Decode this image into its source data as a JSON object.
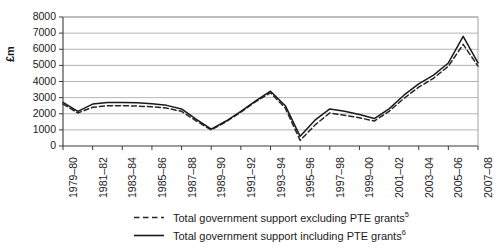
{
  "chart_data": {
    "type": "line",
    "title": "",
    "xlabel": "",
    "ylabel": "£m",
    "ylim": [
      0,
      8000
    ],
    "ytick_step": 1000,
    "yticks": [
      "8000",
      "7000",
      "6000",
      "5000",
      "4000",
      "3000",
      "2000",
      "1000",
      "0"
    ],
    "grid": true,
    "legend_position": "bottom",
    "x": [
      "1979–80",
      "1980–81",
      "1981–82",
      "1982–83",
      "1983–84",
      "1984–85",
      "1985–86",
      "1986–87",
      "1987–88",
      "1988–89",
      "1989–90",
      "1990–91",
      "1991–92",
      "1992–93",
      "1993–94",
      "1994–95",
      "1995–96",
      "1996–97",
      "1997–98",
      "1998–99",
      "1999–00",
      "2000–01",
      "2001–02",
      "2002–03",
      "2003–04",
      "2004–05",
      "2005–06",
      "2006–07",
      "2007–08"
    ],
    "xtick_labels": [
      "1979–80",
      "1981–82",
      "1983–84",
      "1985–86",
      "1987–88",
      "1989–90",
      "1991–92",
      "1993–94",
      "1995–96",
      "1997–98",
      "1999–00",
      "2001–02",
      "2003–04",
      "2005–06",
      "2007–08"
    ],
    "series": [
      {
        "name": "Total government support excluding PTE grants",
        "footnote": "5",
        "style": "dashed",
        "color": "#262626",
        "values": [
          2600,
          2050,
          2400,
          2500,
          2500,
          2480,
          2430,
          2350,
          2150,
          1550,
          1000,
          1500,
          2100,
          2750,
          3300,
          2350,
          350,
          1300,
          2050,
          1900,
          1750,
          1550,
          2150,
          2950,
          3650,
          4200,
          4950,
          6300,
          4950
        ]
      },
      {
        "name": "Total government support including PTE grants",
        "footnote": "6",
        "style": "solid",
        "color": "#1a1a1a",
        "values": [
          2700,
          2150,
          2600,
          2700,
          2700,
          2680,
          2620,
          2520,
          2300,
          1650,
          1050,
          1550,
          2150,
          2800,
          3400,
          2500,
          600,
          1600,
          2300,
          2150,
          1950,
          1700,
          2300,
          3150,
          3850,
          4400,
          5150,
          6800,
          5150
        ]
      }
    ]
  },
  "legend": {
    "items": [
      {
        "label": "Total government support excluding PTE grants",
        "footnote": "5"
      },
      {
        "label": "Total government support including PTE grants",
        "footnote": "6"
      }
    ]
  }
}
